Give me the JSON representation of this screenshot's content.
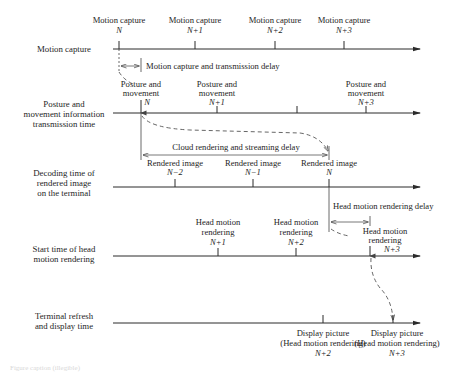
{
  "rows": [
    {
      "label_lines": [
        "Motion capture"
      ]
    },
    {
      "label_lines": [
        "Posture and",
        "movement information",
        "transmission time"
      ]
    },
    {
      "label_lines": [
        "Decoding time of",
        "rendered image",
        "on the terminal"
      ]
    },
    {
      "label_lines": [
        "Start time of head",
        "motion rendering"
      ]
    },
    {
      "label_lines": [
        "Terminal refresh",
        "and display time"
      ]
    }
  ],
  "motion_capture": [
    {
      "title": "Motion capture",
      "index": "N"
    },
    {
      "title": "Motion capture",
      "index": "N+1"
    },
    {
      "title": "Motion capture",
      "index": "N+2"
    },
    {
      "title": "Motion capture",
      "index": "N+3"
    }
  ],
  "posture": [
    {
      "line1": "Posture and",
      "line2": "movement",
      "index": "N"
    },
    {
      "line1": "Posture and",
      "line2": "movement",
      "index": "N+1"
    },
    {
      "line1": "Posture and",
      "line2": "movement",
      "index": "N+3"
    }
  ],
  "rendered": [
    {
      "title": "Rendered image",
      "index": "N−2"
    },
    {
      "title": "Rendered image",
      "index": "N−1"
    },
    {
      "title": "Rendered image",
      "index": "N"
    }
  ],
  "head_motion": [
    {
      "line1": "Head motion",
      "line2": "rendering",
      "index": "N+1"
    },
    {
      "line1": "Head motion",
      "line2": "rendering",
      "index": "N+2"
    },
    {
      "line1": "Head motion",
      "line2": "rendering",
      "index": "N+3"
    }
  ],
  "display": [
    {
      "line1": "Display picture",
      "line2": "(Head motion rendering)",
      "index": "N+2"
    },
    {
      "line1": "Display picture",
      "line2": "(Head motion rendering)",
      "index": "N+3"
    }
  ],
  "delays": {
    "transmission": "Motion capture and transmission delay",
    "cloud": "Cloud rendering and streaming delay",
    "head": "Head motion rendering delay"
  },
  "caption": "Figure caption (illegible)"
}
